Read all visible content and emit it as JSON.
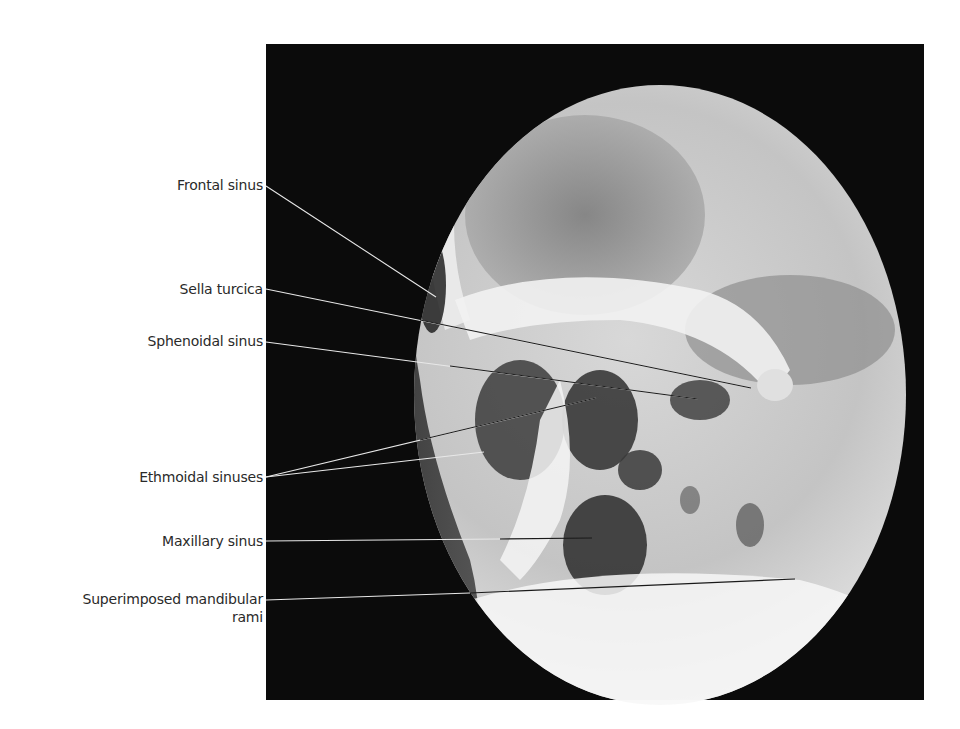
{
  "figure": {
    "type": "lateral skull radiograph with annotated sinuses",
    "colors": {
      "background": "#ffffff",
      "frame": "#0b0b0b",
      "label_text": "#2a2a2a",
      "leader_line_light": "#e8e8e8",
      "leader_line_dark": "#1a1a1a"
    },
    "labels": [
      {
        "id": "frontal",
        "text": "Frontal sinus"
      },
      {
        "id": "sella",
        "text": "Sella turcica"
      },
      {
        "id": "sphenoidal",
        "text": "Sphenoidal sinus"
      },
      {
        "id": "ethmoidal",
        "text": "Ethmoidal sinuses"
      },
      {
        "id": "maxillary",
        "text": "Maxillary sinus"
      },
      {
        "id": "mandibular_line1",
        "text": "Superimposed mandibular"
      },
      {
        "id": "mandibular_line2",
        "text": "rami"
      }
    ]
  }
}
